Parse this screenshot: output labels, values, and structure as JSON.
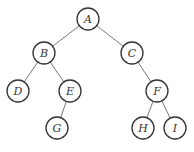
{
  "diagram": {
    "type": "binary-tree",
    "nodes": [
      {
        "id": "A",
        "label": "A",
        "x": 88,
        "y": 19
      },
      {
        "id": "B",
        "label": "B",
        "x": 44,
        "y": 53
      },
      {
        "id": "C",
        "label": "C",
        "x": 132,
        "y": 53
      },
      {
        "id": "D",
        "label": "D",
        "x": 18,
        "y": 91
      },
      {
        "id": "E",
        "label": "E",
        "x": 70,
        "y": 91
      },
      {
        "id": "F",
        "label": "F",
        "x": 157,
        "y": 91
      },
      {
        "id": "G",
        "label": "G",
        "x": 57,
        "y": 128
      },
      {
        "id": "H",
        "label": "H",
        "x": 143,
        "y": 128
      },
      {
        "id": "I",
        "label": "I",
        "x": 175,
        "y": 128
      }
    ],
    "edges": [
      [
        "A",
        "B"
      ],
      [
        "A",
        "C"
      ],
      [
        "B",
        "D"
      ],
      [
        "B",
        "E"
      ],
      [
        "E",
        "G"
      ],
      [
        "C",
        "F"
      ],
      [
        "F",
        "H"
      ],
      [
        "F",
        "I"
      ]
    ],
    "node_radius": 11
  }
}
